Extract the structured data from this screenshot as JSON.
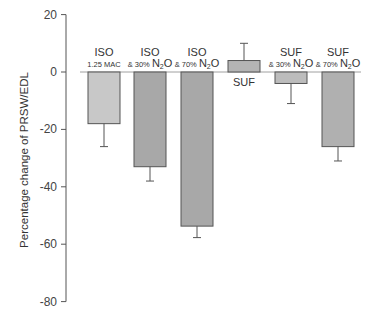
{
  "chart_data": {
    "type": "bar",
    "title": "",
    "xlabel": "",
    "ylabel": "Percentage change of PRSW/EDL",
    "ylim": [
      -80,
      20
    ],
    "yticks": [
      20,
      0,
      -20,
      -40,
      -60,
      -80
    ],
    "grid": false,
    "legend": null,
    "categories": [
      {
        "top": "ISO",
        "sub": "1.25 MAC"
      },
      {
        "top": "ISO",
        "sub": "& 30% N2O"
      },
      {
        "top": "ISO",
        "sub": "& 70% N2O"
      },
      {
        "top": "SUF",
        "sub": ""
      },
      {
        "top": "SUF",
        "sub": "& 30% N2O"
      },
      {
        "top": "SUF",
        "sub": "& 70% N2O"
      }
    ],
    "values": [
      -18,
      -33,
      -53.7,
      4,
      -4,
      -26
    ],
    "error": [
      8,
      5,
      4,
      6,
      7,
      5
    ],
    "bar_fill": [
      "#c8c8c8",
      "#a8a8a8",
      "#a8a8a8",
      "#b4b4b4",
      "#bcbcbc",
      "#b0b0b0"
    ]
  }
}
